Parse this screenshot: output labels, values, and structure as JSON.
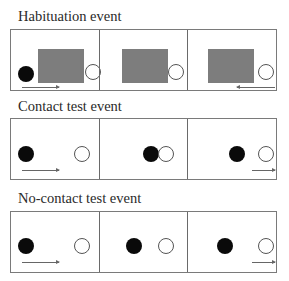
{
  "figure": {
    "rows": [
      {
        "title": "Habituation event",
        "panels": [
          {
            "index": 1,
            "objects": [
              "black-ball",
              "screen",
              "white-ball-behind-screen"
            ],
            "arrow": "right"
          },
          {
            "index": 2,
            "objects": [
              "screen",
              "white-ball-behind-screen"
            ],
            "arrow": "none"
          },
          {
            "index": 3,
            "objects": [
              "screen",
              "white-ball"
            ],
            "arrow": "left"
          }
        ]
      },
      {
        "title": "Contact test event",
        "panels": [
          {
            "index": 1,
            "objects": [
              "black-ball",
              "white-ball"
            ],
            "arrow": "right"
          },
          {
            "index": 2,
            "objects": [
              "black-ball-touching",
              "white-ball"
            ],
            "arrow": "none"
          },
          {
            "index": 3,
            "objects": [
              "black-ball",
              "white-ball"
            ],
            "arrow": "right"
          }
        ]
      },
      {
        "title": "No-contact test event",
        "panels": [
          {
            "index": 1,
            "objects": [
              "black-ball",
              "white-ball"
            ],
            "arrow": "right"
          },
          {
            "index": 2,
            "objects": [
              "black-ball",
              "white-ball"
            ],
            "arrow": "none"
          },
          {
            "index": 3,
            "objects": [
              "black-ball",
              "white-ball"
            ],
            "arrow": "right"
          }
        ]
      }
    ],
    "colors": {
      "black_ball": "#0a0a0a",
      "white_ball": "#ffffff",
      "screen": "#7d7d7d",
      "border": "#7a7a7a"
    }
  }
}
